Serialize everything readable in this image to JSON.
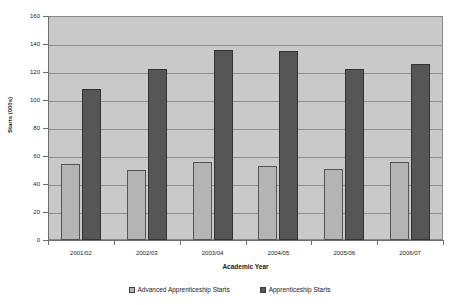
{
  "chart_data": {
    "type": "bar",
    "title": "",
    "xlabel": "Academic Year",
    "ylabel": "Starts (000s)",
    "categories": [
      "2001/02",
      "2002/03",
      "2003/04",
      "2004/05",
      "2005/06",
      "2006/07"
    ],
    "series": [
      {
        "name": "Advanced Apprenticeship Starts",
        "color": "#b4b4b4",
        "values": [
          54,
          50,
          56,
          53,
          51,
          56
        ]
      },
      {
        "name": "Apprenticeship Starts",
        "color": "#565656",
        "values": [
          108,
          122,
          136,
          135,
          122,
          126
        ]
      }
    ],
    "ylim": [
      0,
      160
    ],
    "ytick_step": 20,
    "yticks": [
      "160",
      "140",
      "120",
      "100",
      "80",
      "60",
      "40",
      "20",
      "0"
    ],
    "grid": true,
    "legend_position": "bottom",
    "plot_background": "#c9c9c9"
  },
  "legend": {
    "items": [
      {
        "label": "Advanced Apprenticeship Starts"
      },
      {
        "label": "Apprenticeship Starts"
      }
    ]
  },
  "axes": {
    "x_title": "Academic Year",
    "y_title": "Starts (000s)"
  }
}
